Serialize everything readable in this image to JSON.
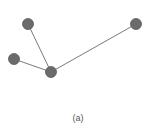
{
  "diagram": {
    "type": "graph",
    "caption": "(a)",
    "colors": {
      "node_fill": "#6b6b6b",
      "node_stroke": "#5a5a5a",
      "edge": "#7a7a7a"
    },
    "node_radius": 5.5,
    "nodes": [
      {
        "id": "n1",
        "x": 28,
        "y": 24
      },
      {
        "id": "n2",
        "x": 136,
        "y": 24
      },
      {
        "id": "n3",
        "x": 14,
        "y": 59
      },
      {
        "id": "n4",
        "x": 51,
        "y": 72
      }
    ],
    "edges": [
      {
        "from": "n1",
        "to": "n4"
      },
      {
        "from": "n3",
        "to": "n4"
      },
      {
        "from": "n2",
        "to": "n4"
      }
    ]
  }
}
